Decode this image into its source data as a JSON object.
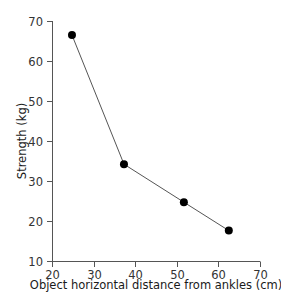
{
  "chart_data": {
    "type": "line",
    "title": "",
    "xlabel": "Object horizontal distance from ankles (cm)",
    "ylabel": "Strength (kg)",
    "xlim": [
      20,
      70
    ],
    "ylim": [
      10,
      70
    ],
    "xticks": [
      20,
      30,
      40,
      50,
      60,
      70
    ],
    "yticks": [
      10,
      20,
      30,
      40,
      50,
      60,
      70
    ],
    "xtick_labels": [
      "20",
      "30",
      "40",
      "50",
      "60",
      "70"
    ],
    "ytick_labels": [
      "10",
      "20",
      "30",
      "40",
      "50",
      "60",
      "70"
    ],
    "grid": false,
    "legend": false,
    "marker": "filled-circle",
    "marker_size": 8,
    "marker_color": "#000000",
    "line_color": "#555555",
    "line_width": 1,
    "axis_color": "#555555",
    "series": [
      {
        "name": "Strength vs distance",
        "x": [
          24.8,
          37.3,
          51.7,
          62.5
        ],
        "values": [
          66.5,
          34.2,
          24.7,
          17.6
        ]
      }
    ]
  },
  "axes": {
    "y_title": "Strength (kg)",
    "x_title": "Object horizontal distance from ankles (cm)"
  }
}
